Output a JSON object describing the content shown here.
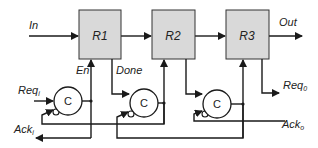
{
  "diagram": {
    "colors": {
      "register_fill": "#d9d9d9",
      "wire": "#1a1a1a",
      "background": "#ffffff"
    },
    "registers": [
      {
        "id": "r1",
        "label": "R1"
      },
      {
        "id": "r2",
        "label": "R2"
      },
      {
        "id": "r3",
        "label": "R3"
      }
    ],
    "c_elements": [
      {
        "id": "c1",
        "label": "C"
      },
      {
        "id": "c2",
        "label": "C"
      },
      {
        "id": "c3",
        "label": "C"
      }
    ],
    "signals": {
      "in": "In",
      "out": "Out",
      "en": "En",
      "done": "Done",
      "req_in": "Req",
      "req_in_sub": "i",
      "ack_in": "Ack",
      "ack_in_sub": "i",
      "req_out": "Req",
      "req_out_sub": "0",
      "ack_out": "Ack",
      "ack_out_sub": "o"
    }
  }
}
